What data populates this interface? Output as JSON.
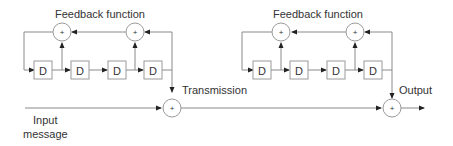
{
  "diagram": {
    "left_block": {
      "title": "Feedback function",
      "registers": [
        "D",
        "D",
        "D",
        "D"
      ],
      "adder_symbol": "+"
    },
    "right_block": {
      "title": "Feedback function",
      "registers": [
        "D",
        "D",
        "D",
        "D"
      ],
      "adder_symbol": "+"
    },
    "labels": {
      "transmission": "Transmission",
      "output": "Output",
      "input_line1": "Input",
      "input_line2": "message"
    },
    "colors": {
      "line": "#8a8a8a",
      "box_stroke": "#9a9a9a",
      "text": "#333333",
      "arrow": "#222222"
    }
  }
}
